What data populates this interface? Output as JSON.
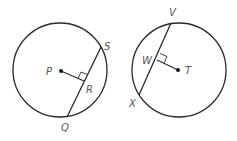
{
  "figures": [
    {
      "name": "left-circle",
      "center_label": "P",
      "chord_endpoints": [
        "S",
        "Q"
      ],
      "foot_of_perpendicular": "R",
      "labels": {
        "center": "P",
        "chord_top": "S",
        "chord_bottom": "Q",
        "foot": "R"
      }
    },
    {
      "name": "right-circle",
      "center_label": "T",
      "chord_endpoints": [
        "V",
        "X"
      ],
      "foot_of_perpendicular": "W",
      "labels": {
        "center": "T",
        "chord_top": "V",
        "chord_bottom": "X",
        "foot": "W"
      }
    }
  ],
  "colors": {
    "stroke": "#2a2a2a",
    "label": "#555555",
    "background": "#ffffff"
  }
}
